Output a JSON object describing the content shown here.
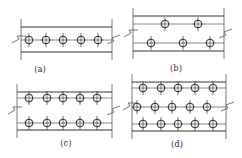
{
  "figure": {
    "panels": [
      {
        "id": "a",
        "label": "(a)",
        "x0": 21,
        "x1": 112,
        "lines": [
          27,
          52
        ],
        "gauge_lines": [
          40
        ],
        "rows": [
          {
            "y": 40,
            "xs": [
              29,
              46,
              63,
              81,
              98
            ]
          }
        ],
        "break_y": 40,
        "label_pos": [
          40,
          72
        ]
      },
      {
        "id": "b",
        "label": "(b)",
        "x0": 133,
        "x1": 224,
        "lines": [
          16,
          51
        ],
        "gauge_lines": [
          24,
          43
        ],
        "rows": [
          {
            "y": 24,
            "xs": [
              165,
              198
            ]
          },
          {
            "y": 43,
            "xs": [
              151,
              183,
              210
            ]
          }
        ],
        "break_y": 34,
        "label_pos": [
          176,
          71
        ]
      },
      {
        "id": "c",
        "label": "(c)",
        "x0": 17,
        "x1": 112,
        "lines": [
          92,
          130
        ],
        "gauge_lines": [
          98,
          123
        ],
        "rows": [
          {
            "y": 98,
            "xs": [
              29,
              47,
              63,
              80,
              97
            ]
          },
          {
            "y": 123,
            "xs": [
              29,
              47,
              63,
              80,
              97
            ]
          }
        ],
        "break_y": 111,
        "label_pos": [
          66,
          146
        ]
      },
      {
        "id": "d",
        "label": "(d)",
        "x0": 132,
        "x1": 226,
        "lines": [
          82,
          131
        ],
        "gauge_lines": [
          88,
          107,
          124
        ],
        "rows": [
          {
            "y": 88,
            "xs": [
              143,
              161,
              178,
              195,
              213
            ]
          },
          {
            "y": 107,
            "xs": [
              137,
              155,
              172,
              190,
              207
            ]
          },
          {
            "y": 124,
            "xs": [
              143,
              161,
              178,
              195,
              213
            ]
          }
        ],
        "break_y": 107,
        "label_pos": [
          177,
          147
        ]
      }
    ]
  }
}
